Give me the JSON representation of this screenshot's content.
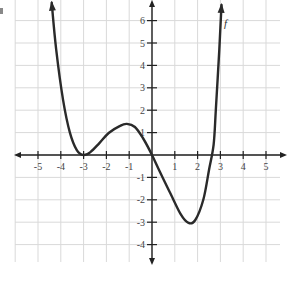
{
  "chart_data": {
    "type": "line",
    "title": "",
    "xlabel": "",
    "ylabel": "",
    "function_label": "f",
    "xlim": [
      -6,
      6
    ],
    "ylim": [
      -5,
      7
    ],
    "grid": true,
    "legend": null,
    "x_ticks": [
      -5,
      -4,
      -3,
      -2,
      -1,
      1,
      2,
      3,
      4,
      5
    ],
    "x_tick_labels": [
      "-5",
      "-4",
      "-3",
      "-2",
      "-1",
      "1",
      "2",
      "3",
      "4",
      "5"
    ],
    "y_ticks": [
      6,
      5,
      4,
      3,
      2,
      1,
      -1,
      -2,
      -3,
      -4
    ],
    "y_tick_labels": [
      "6",
      "5",
      "4",
      "3",
      "2",
      "1",
      "-1",
      "-2",
      "-3",
      "-4"
    ],
    "series": [
      {
        "name": "f",
        "x": [
          -4.4,
          -4.2,
          -3.9,
          -3.6,
          -3.3,
          -3.0,
          -2.7,
          -2.3,
          -1.9,
          -1.4,
          -1.1,
          -0.75,
          -0.4,
          0.0,
          0.35,
          0.8,
          1.25,
          1.6,
          1.9,
          2.25,
          2.5,
          2.7,
          2.8,
          2.95,
          3.05
        ],
        "y": [
          6.8,
          4.7,
          2.45,
          1.0,
          0.22,
          0.0,
          0.13,
          0.54,
          0.98,
          1.3,
          1.39,
          1.25,
          0.76,
          0.0,
          -0.76,
          -1.7,
          -2.63,
          -3.03,
          -2.9,
          -2.0,
          -0.67,
          0.45,
          2.0,
          4.7,
          6.7
        ]
      }
    ],
    "annotations": [
      {
        "type": "arrow",
        "at": [
          -4.4,
          6.8
        ],
        "direction": "up"
      },
      {
        "type": "arrow",
        "at": [
          3.05,
          6.7
        ],
        "direction": "up"
      },
      {
        "type": "label",
        "text": "f",
        "at": [
          3.3,
          5.9
        ]
      }
    ],
    "key_points": {
      "local_min_touch": [
        -3,
        0
      ],
      "local_max": [
        -1.1,
        1.4
      ],
      "zero_crossing_origin": [
        0,
        0
      ],
      "local_min": [
        1.6,
        -3.05
      ],
      "zero_crossing_right": [
        2.6,
        0
      ]
    }
  },
  "layout": {
    "origin_px": [
      152,
      155
    ],
    "unit_x_px": 22.8,
    "unit_y_px": 22.4,
    "colors": {
      "curve": "#2a2a2a",
      "axis": "#222222",
      "grid": "#d9d9d9",
      "text": "#444444"
    }
  }
}
